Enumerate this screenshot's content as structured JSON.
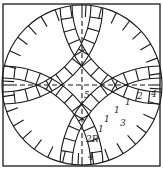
{
  "diagram": {
    "labels": [
      {
        "id": "5",
        "text": "5",
        "x": 84,
        "y": 98
      },
      {
        "id": "4-right",
        "text": "4",
        "x": 151,
        "y": 97
      },
      {
        "id": "2",
        "text": "2",
        "x": 137,
        "y": 99
      },
      {
        "id": "1a",
        "text": "1",
        "x": 125,
        "y": 105
      },
      {
        "id": "1b",
        "text": "1",
        "x": 114,
        "y": 113
      },
      {
        "id": "1c",
        "text": "1",
        "x": 104,
        "y": 122
      },
      {
        "id": "1d",
        "text": "1",
        "x": 98,
        "y": 132
      },
      {
        "id": "3",
        "text": "3",
        "x": 120,
        "y": 126
      },
      {
        "id": "2R",
        "text": "2R",
        "x": 86,
        "y": 142
      },
      {
        "id": "4-bottom",
        "text": "4",
        "x": 88,
        "y": 160
      }
    ],
    "colors": {
      "line": "#1a1a1a",
      "background": "#ffffff"
    }
  }
}
